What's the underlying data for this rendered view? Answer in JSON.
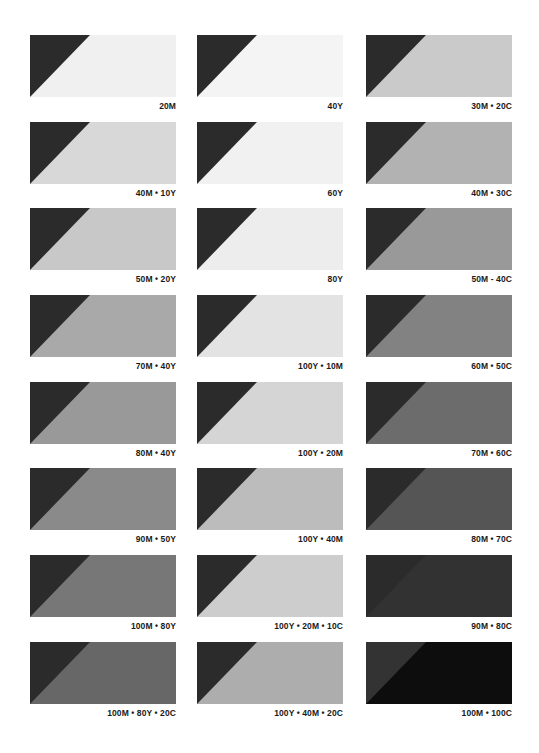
{
  "swatch_chart": {
    "layout": {
      "columns": 3,
      "rows": 8
    },
    "triangle_color": "#2b2b2b",
    "columns": [
      {
        "swatches": [
          {
            "label": "20M",
            "fill": "#f0f0f0",
            "triangle": "#2b2b2b"
          },
          {
            "label": "40M • 10Y",
            "fill": "#d8d8d8",
            "triangle": "#2b2b2b"
          },
          {
            "label": "50M • 20Y",
            "fill": "#c8c8c8",
            "triangle": "#2b2b2b"
          },
          {
            "label": "70M • 40Y",
            "fill": "#a9a9a9",
            "triangle": "#2b2b2b"
          },
          {
            "label": "80M • 40Y",
            "fill": "#999999",
            "triangle": "#2b2b2b"
          },
          {
            "label": "90M • 50Y",
            "fill": "#8a8a8a",
            "triangle": "#2b2b2b"
          },
          {
            "label": "100M • 80Y",
            "fill": "#777777",
            "triangle": "#2b2b2b"
          },
          {
            "label": "100M • 80Y • 20C",
            "fill": "#676767",
            "triangle": "#2b2b2b"
          }
        ]
      },
      {
        "swatches": [
          {
            "label": "40Y",
            "fill": "#f4f4f4",
            "triangle": "#2b2b2b"
          },
          {
            "label": "60Y",
            "fill": "#f1f1f1",
            "triangle": "#2b2b2b"
          },
          {
            "label": "80Y",
            "fill": "#ededed",
            "triangle": "#2b2b2b"
          },
          {
            "label": "100Y • 10M",
            "fill": "#e3e3e3",
            "triangle": "#2b2b2b"
          },
          {
            "label": "100Y • 20M",
            "fill": "#d5d5d5",
            "triangle": "#2b2b2b"
          },
          {
            "label": "100Y • 40M",
            "fill": "#bcbcbc",
            "triangle": "#2b2b2b"
          },
          {
            "label": "100Y • 20M • 10C",
            "fill": "#cdcdcd",
            "triangle": "#2b2b2b"
          },
          {
            "label": "100Y • 40M • 20C",
            "fill": "#adadad",
            "triangle": "#2b2b2b"
          }
        ]
      },
      {
        "swatches": [
          {
            "label": "30M • 20C",
            "fill": "#cacaca",
            "triangle": "#2b2b2b"
          },
          {
            "label": "40M • 30C",
            "fill": "#b2b2b2",
            "triangle": "#2b2b2b"
          },
          {
            "label": "50M - 40C",
            "fill": "#999999",
            "triangle": "#2b2b2b"
          },
          {
            "label": "60M • 50C",
            "fill": "#828282",
            "triangle": "#2b2b2b"
          },
          {
            "label": "70M • 60C",
            "fill": "#6c6c6c",
            "triangle": "#2b2b2b"
          },
          {
            "label": "80M • 70C",
            "fill": "#555555",
            "triangle": "#2b2b2b"
          },
          {
            "label": "90M • 80C",
            "fill": "#323232",
            "triangle": "#2b2b2b"
          },
          {
            "label": "100M • 100C",
            "fill": "#0d0d0d",
            "triangle": "#333333"
          }
        ]
      }
    ]
  }
}
